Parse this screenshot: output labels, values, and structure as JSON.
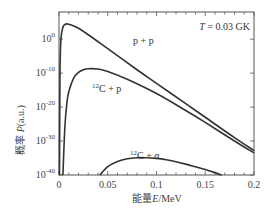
{
  "chart_data": {
    "type": "line",
    "title": "",
    "annotation": "T = 0.03 GK",
    "xlabel": "能量E/MeV",
    "ylabel": "概率 P(a.u.)",
    "xlim": [
      0,
      0.2
    ],
    "ylim_log10": [
      -40,
      8
    ],
    "yscale": "log",
    "x_ticks": [
      "0",
      "0.05",
      "0.1",
      "0.15",
      "0.2"
    ],
    "y_ticks": [
      {
        "base": "10",
        "exp": "0"
      },
      {
        "base": "10",
        "exp": "-10"
      },
      {
        "base": "10",
        "exp": "-20"
      },
      {
        "base": "10",
        "exp": "-30"
      },
      {
        "base": "10",
        "exp": "-40"
      }
    ],
    "grid": false,
    "series": [
      {
        "name": "p + p",
        "label_sup": "",
        "label_main": "p + p",
        "x": [
          0.0005,
          0.001,
          0.002,
          0.004,
          0.006,
          0.008,
          0.01,
          0.015,
          0.02,
          0.03,
          0.05,
          0.08,
          0.1,
          0.13,
          0.15,
          0.18,
          0.2
        ],
        "log10_y": [
          -40,
          -10,
          0,
          3.5,
          4.3,
          4.5,
          4.4,
          3.9,
          3.2,
          1.3,
          -2.8,
          -9.0,
          -13.0,
          -19.0,
          -23.0,
          -29.0,
          -32.8
        ]
      },
      {
        "name": "12C + p",
        "label_sup": "12",
        "label_main": "C + p",
        "x": [
          0.004,
          0.006,
          0.008,
          0.01,
          0.015,
          0.02,
          0.025,
          0.03,
          0.04,
          0.05,
          0.07,
          0.1,
          0.13,
          0.15,
          0.18,
          0.2
        ],
        "log10_y": [
          -40,
          -26,
          -19,
          -15.5,
          -11.5,
          -9.8,
          -9.0,
          -8.7,
          -8.8,
          -9.5,
          -11.8,
          -16.0,
          -21.0,
          -24.5,
          -30.0,
          -33.5
        ]
      },
      {
        "name": "12C + α",
        "label_sup": "12",
        "label_main": "C + α",
        "x": [
          0.042,
          0.05,
          0.06,
          0.07,
          0.08,
          0.09,
          0.1,
          0.11,
          0.12,
          0.13,
          0.14,
          0.15,
          0.16,
          0.167
        ],
        "log10_y": [
          -40,
          -37.5,
          -36.0,
          -35.2,
          -34.9,
          -34.9,
          -35.1,
          -35.5,
          -36.1,
          -36.8,
          -37.6,
          -38.4,
          -39.3,
          -40
        ]
      }
    ]
  }
}
